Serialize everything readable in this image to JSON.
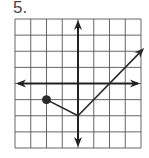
{
  "problem": {
    "number_label": "5."
  },
  "graph": {
    "grid": {
      "columns": 8,
      "rows": 8,
      "x_range": [
        -4,
        4
      ],
      "y_range": [
        -4,
        4
      ],
      "line_color": "#555555",
      "axis_color": "#222222"
    },
    "function": {
      "description": "Piecewise linear graph: closed point at (-2,-1), segment to vertex (0,-2), then ray with slope 1 through (2,0) continuing up-right with arrow",
      "start_point": {
        "x": -2,
        "y": -1,
        "closed": true
      },
      "vertex": {
        "x": 0,
        "y": -2
      },
      "ray_through": {
        "x": 2,
        "y": 0
      },
      "ray_end": {
        "x": 4.2,
        "y": 2.2
      },
      "left_slope": -0.5,
      "right_slope": 1,
      "color": "#2a2a2a"
    }
  }
}
